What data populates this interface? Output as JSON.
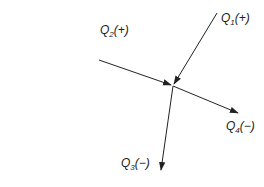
{
  "diagram": {
    "type": "flow-junction",
    "junction": {
      "x": 173,
      "y": 86
    },
    "flows": [
      {
        "id": "Q1",
        "symbol": "Q",
        "sub": "1",
        "sign": "(+)",
        "direction": "in",
        "from": [
          217,
          13
        ],
        "to": [
          173,
          86
        ]
      },
      {
        "id": "Q2",
        "symbol": "Q",
        "sub": "2",
        "sign": "(+)",
        "direction": "in",
        "from": [
          99,
          60
        ],
        "to": [
          173,
          86
        ]
      },
      {
        "id": "Q3",
        "symbol": "Q",
        "sub": "3",
        "sign": "(−)",
        "direction": "out",
        "from": [
          173,
          86
        ],
        "to": [
          160,
          170
        ]
      },
      {
        "id": "Q4",
        "symbol": "Q",
        "sub": "4",
        "sign": "(−)",
        "direction": "out",
        "from": [
          173,
          86
        ],
        "to": [
          238,
          113
        ]
      }
    ],
    "colors": {
      "line": "#222222",
      "background": "#ffffff"
    }
  }
}
